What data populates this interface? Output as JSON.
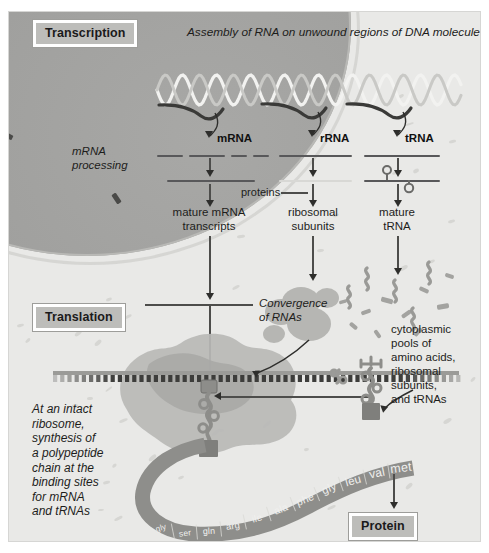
{
  "figure": {
    "headline": "Assembly of RNA on unwound regions of DNA molecule",
    "sections": {
      "transcription": "Transcription",
      "translation": "Translation",
      "protein": "Protein"
    }
  },
  "nucleus": {
    "processing_label": "mRNA\nprocessing",
    "rna_types": [
      {
        "name": "mRNA",
        "product": "mature mRNA\ntranscripts"
      },
      {
        "name": "rRNA",
        "product": "ribosomal\nsubunits"
      },
      {
        "name": "tRNA",
        "product": "mature\ntRNA"
      }
    ],
    "proteins_label": "proteins"
  },
  "cytoplasm": {
    "convergence_label": "Convergence\nof RNAs",
    "pools_label": "cytoplasmic\npools of\namino acids,\nribosomal\nsubunits,\nand tRNAs",
    "ribosome_caption": "At an intact\nribosome,\nsynthesis of\na polypeptide\nchain at the\nbinding sites\nfor mRNA\nand tRNAs"
  },
  "polypeptide": {
    "residues": [
      "gly",
      "ser",
      "gln",
      "arg",
      "ile",
      "ala",
      "phe",
      "gly",
      "leu",
      "val",
      "met"
    ]
  },
  "colors": {
    "background": "#e9e9e7",
    "nucleus": "#9e9e9c",
    "ink": "#1d1d1b",
    "chip_fill": "#bdbdba",
    "chain": "#8e8e8b",
    "ribosome": "#b4b4b1"
  }
}
